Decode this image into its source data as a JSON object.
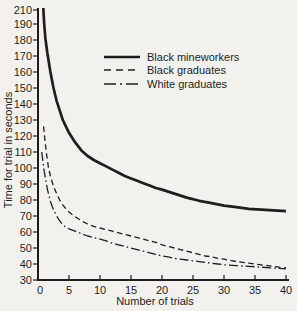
{
  "figure": {
    "background": "#f2f1ed",
    "ink": "#1e1e1e"
  },
  "chart_data": {
    "type": "line",
    "title": "",
    "xlabel": "Number of trials",
    "ylabel": "Time for trial in seconds",
    "xlim": [
      0,
      40
    ],
    "ylim": [
      30,
      210
    ],
    "x_ticks": [
      0,
      5,
      10,
      15,
      20,
      25,
      30,
      35,
      40
    ],
    "y_ticks": [
      210,
      190,
      180,
      170,
      160,
      150,
      140,
      130,
      120,
      110,
      100,
      90,
      80,
      70,
      60,
      50,
      40,
      30
    ],
    "grid": false,
    "legend_position": "upper-left-inside",
    "series": [
      {
        "name": "Black mineworkers",
        "style": "solid",
        "points": [
          [
            0.85,
            200
          ],
          [
            1,
            190
          ],
          [
            1.2,
            181
          ],
          [
            1.5,
            172
          ],
          [
            2,
            160
          ],
          [
            2.5,
            150
          ],
          [
            3,
            142
          ],
          [
            3.5,
            136
          ],
          [
            4,
            130
          ],
          [
            4.5,
            126
          ],
          [
            5,
            122
          ],
          [
            6,
            116
          ],
          [
            7,
            111
          ],
          [
            8,
            107.5
          ],
          [
            9,
            105
          ],
          [
            10,
            103
          ],
          [
            11,
            101
          ],
          [
            12,
            99
          ],
          [
            13,
            97
          ],
          [
            14,
            95
          ],
          [
            15,
            93.5
          ],
          [
            16,
            92
          ],
          [
            17,
            90.5
          ],
          [
            18,
            89
          ],
          [
            19,
            87.5
          ],
          [
            20,
            86.5
          ],
          [
            22,
            84
          ],
          [
            24,
            81.5
          ],
          [
            26,
            79.5
          ],
          [
            28,
            78
          ],
          [
            30,
            76.5
          ],
          [
            32,
            75.5
          ],
          [
            34,
            74.5
          ],
          [
            36,
            74
          ],
          [
            38,
            73.5
          ],
          [
            40,
            73
          ]
        ]
      },
      {
        "name": "Black graduates",
        "style": "dashed",
        "points": [
          [
            0.9,
            126
          ],
          [
            1.1,
            118
          ],
          [
            1.4,
            108
          ],
          [
            1.7,
            100
          ],
          [
            2,
            95
          ],
          [
            2.5,
            88.5
          ],
          [
            3,
            84
          ],
          [
            3.5,
            80
          ],
          [
            4,
            77
          ],
          [
            4.5,
            74.5
          ],
          [
            5,
            72.5
          ],
          [
            5.5,
            71
          ],
          [
            6,
            69.5
          ],
          [
            7,
            67
          ],
          [
            8,
            65
          ],
          [
            9,
            63.5
          ],
          [
            10,
            62.5
          ],
          [
            11,
            61.5
          ],
          [
            12,
            60.5
          ],
          [
            13,
            59.5
          ],
          [
            14,
            58.5
          ],
          [
            15,
            57.5
          ],
          [
            16,
            56.5
          ],
          [
            17,
            55.5
          ],
          [
            18,
            54.5
          ],
          [
            19,
            53.5
          ],
          [
            20,
            52
          ],
          [
            21,
            51
          ],
          [
            22,
            50
          ],
          [
            23,
            49
          ],
          [
            24,
            48
          ],
          [
            25,
            47
          ],
          [
            26,
            46
          ],
          [
            27,
            45
          ],
          [
            28,
            44.5
          ],
          [
            29,
            43.5
          ],
          [
            30,
            43
          ],
          [
            32,
            41.5
          ],
          [
            34,
            40.5
          ],
          [
            36,
            39.5
          ],
          [
            38,
            38.5
          ],
          [
            40,
            37.5
          ]
        ]
      },
      {
        "name": "White graduates",
        "style": "dashdot",
        "points": [
          [
            0.6,
            110
          ],
          [
            1,
            98
          ],
          [
            1.5,
            87
          ],
          [
            2,
            79
          ],
          [
            2.5,
            74
          ],
          [
            3,
            70
          ],
          [
            3.5,
            67
          ],
          [
            4,
            64.5
          ],
          [
            4.5,
            63
          ],
          [
            5,
            62
          ],
          [
            6,
            60.5
          ],
          [
            7,
            59
          ],
          [
            8,
            57.5
          ],
          [
            9,
            56.5
          ],
          [
            10,
            55.5
          ],
          [
            11,
            54.5
          ],
          [
            12,
            53
          ],
          [
            13,
            52
          ],
          [
            14,
            51
          ],
          [
            15,
            50
          ],
          [
            16,
            49
          ],
          [
            17,
            48
          ],
          [
            18,
            47
          ],
          [
            19,
            46
          ],
          [
            20,
            45
          ],
          [
            21,
            44.5
          ],
          [
            22,
            43.5
          ],
          [
            23,
            43
          ],
          [
            24,
            42.5
          ],
          [
            25,
            42
          ],
          [
            26,
            41.5
          ],
          [
            27,
            41
          ],
          [
            28,
            40.5
          ],
          [
            29,
            40
          ],
          [
            30,
            39.5
          ],
          [
            32,
            39
          ],
          [
            34,
            38.5
          ],
          [
            36,
            38
          ],
          [
            38,
            37.5
          ],
          [
            40,
            37
          ]
        ]
      }
    ]
  }
}
